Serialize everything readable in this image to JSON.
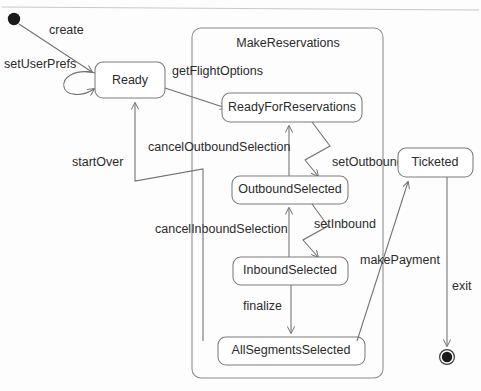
{
  "diagram": {
    "title": "MakeReservations",
    "type": "uml-state-machine",
    "colors": {
      "stroke": "#7c7c7c",
      "text": "#2b2b2b",
      "background": "#fdfdfd",
      "node": "#1a1a1a"
    },
    "composite_region": {
      "label": "MakeReservations"
    },
    "states": [
      {
        "id": "ready",
        "label": "Ready"
      },
      {
        "id": "ready-for-reservations",
        "label": "ReadyForReservations"
      },
      {
        "id": "outbound-selected",
        "label": "OutboundSelected"
      },
      {
        "id": "inbound-selected",
        "label": "InboundSelected"
      },
      {
        "id": "all-segments-selected",
        "label": "AllSegmentsSelected"
      },
      {
        "id": "ticketed",
        "label": "Ticketed"
      }
    ],
    "pseudostates": [
      {
        "id": "initial",
        "kind": "initial"
      },
      {
        "id": "final",
        "kind": "final"
      }
    ],
    "transitions": [
      {
        "id": "create",
        "label": "create",
        "from": "initial",
        "to": "ready"
      },
      {
        "id": "set-user-prefs",
        "label": "setUserPrefs",
        "from": "ready",
        "to": "ready"
      },
      {
        "id": "get-flight-options",
        "label": "getFlightOptions",
        "from": "ready",
        "to": "ready-for-reservations"
      },
      {
        "id": "set-outbound",
        "label": "setOutbound",
        "from": "ready-for-reservations",
        "to": "outbound-selected"
      },
      {
        "id": "cancel-outbound-selection",
        "label": "cancelOutboundSelection",
        "from": "outbound-selected",
        "to": "ready-for-reservations"
      },
      {
        "id": "set-inbound",
        "label": "setInbound",
        "from": "outbound-selected",
        "to": "inbound-selected"
      },
      {
        "id": "cancel-inbound-selection",
        "label": "cancelInboundSelection",
        "from": "inbound-selected",
        "to": "outbound-selected"
      },
      {
        "id": "finalize",
        "label": "finalize",
        "from": "inbound-selected",
        "to": "all-segments-selected"
      },
      {
        "id": "start-over",
        "label": "startOver",
        "from": "make-reservations",
        "to": "ready"
      },
      {
        "id": "make-payment",
        "label": "makePayment",
        "from": "all-segments-selected",
        "to": "ticketed"
      },
      {
        "id": "exit",
        "label": "exit",
        "from": "ticketed",
        "to": "final"
      }
    ]
  }
}
